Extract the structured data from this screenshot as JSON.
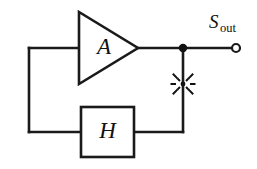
{
  "diagram": {
    "type": "block-diagram",
    "background_color": "#ffffff",
    "line_color": "#1a1a1a",
    "blocks": [
      {
        "id": "amplifier",
        "shape": "triangle",
        "label": "A",
        "meaning": "forward gain amplifier"
      },
      {
        "id": "feedback",
        "shape": "rectangle",
        "label": "H",
        "meaning": "feedback network"
      }
    ],
    "signals": [
      {
        "id": "output",
        "label_main": "S",
        "label_sub": "out",
        "meaning": "output signal terminal"
      }
    ],
    "markers": [
      {
        "id": "noise-burst",
        "icon": "noise-burst-icon",
        "meaning": "noise injection point on feedback tap"
      },
      {
        "id": "output-node",
        "icon": "junction-dot-icon",
        "meaning": "output junction node"
      },
      {
        "id": "output-terminal",
        "icon": "open-terminal-icon",
        "meaning": "open circuit output terminal"
      }
    ]
  }
}
